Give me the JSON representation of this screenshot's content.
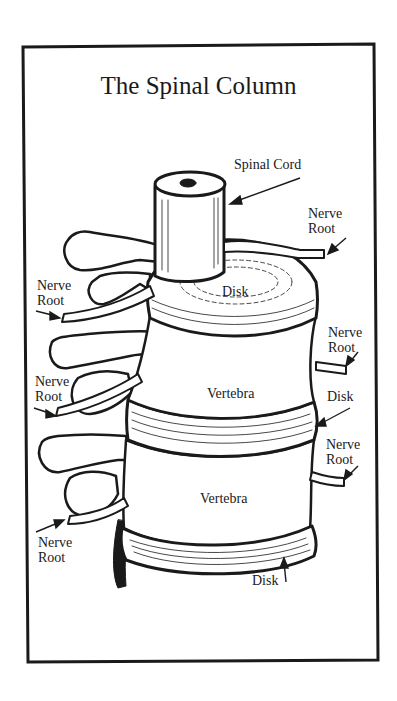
{
  "title": "The Spinal Column",
  "labels": {
    "spinal_cord": "Spinal Cord",
    "nerve_root_top_right": [
      "Nerve",
      "Root"
    ],
    "nerve_root_upper_left": [
      "Nerve",
      "Root"
    ],
    "disk_top": "Disk",
    "nerve_root_mid_right": [
      "Nerve",
      "Root"
    ],
    "nerve_root_mid_left": [
      "Nerve",
      "Root"
    ],
    "vertebra_upper": "Vertebra",
    "disk_right": "Disk",
    "nerve_root_lower_right": [
      "Nerve",
      "Root"
    ],
    "vertebra_lower": "Vertebra",
    "nerve_root_lower_left": [
      "Nerve",
      "Root"
    ],
    "disk_bottom": "Disk"
  },
  "colors": {
    "ink": "#1a1a1a",
    "paper": "#ffffff"
  }
}
